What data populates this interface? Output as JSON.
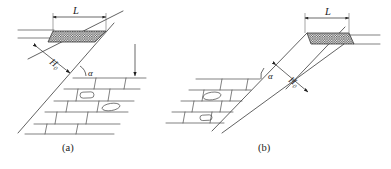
{
  "figure": {
    "type": "engineering-cross-section-diagram",
    "background_color": "#ffffff",
    "line_color": "#3a3a3a",
    "hatch_fill_color": "#585858"
  },
  "panels": [
    {
      "id": "a",
      "caption": "(a)",
      "labels": {
        "length": "L",
        "height_main": "H",
        "height_subscript": "0",
        "angle": "α"
      },
      "seam_dip_direction": "down-left",
      "features": [
        "hatched-seam-band",
        "dip-angle-marker",
        "thickness-dimension-arrow",
        "length-dimension-arrow",
        "vertical-reference-arrow",
        "bedded-rock-masonry-pattern",
        "gravel-inclusions"
      ]
    },
    {
      "id": "b",
      "caption": "(b)",
      "labels": {
        "length": "L",
        "height_main": "H",
        "height_subscript": "0",
        "angle": "α"
      },
      "seam_dip_direction": "up-right",
      "features": [
        "hatched-seam-band",
        "dip-angle-marker",
        "thickness-dimension-arrow",
        "length-dimension-arrow",
        "bedded-rock-masonry-pattern",
        "gravel-inclusions"
      ]
    }
  ]
}
